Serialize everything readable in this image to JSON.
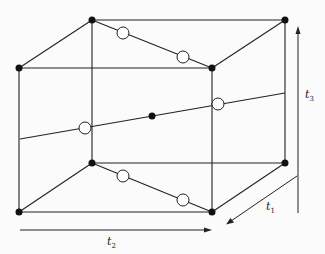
{
  "diagram": {
    "type": "cube-lattice",
    "axes": [
      {
        "id": "t1",
        "label": "t",
        "subscript": "1",
        "direction": "depth"
      },
      {
        "id": "t2",
        "label": "t",
        "subscript": "2",
        "direction": "horizontal"
      },
      {
        "id": "t3",
        "label": "t",
        "subscript": "3",
        "direction": "vertical"
      }
    ],
    "vertices": 8,
    "filled_center_points": 1,
    "open_circles": 6
  }
}
